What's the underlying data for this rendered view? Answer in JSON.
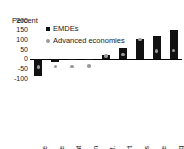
{
  "chart_data": {
    "type": "bar",
    "title": "",
    "subtitle": "",
    "xlabel": "",
    "ylabel": "Percent",
    "unit_label": "Percent",
    "ylim": [
      -100,
      200
    ],
    "yticks": [
      200,
      150,
      100,
      50,
      0,
      -50,
      -100
    ],
    "ytick_labels": [
      "200",
      "150",
      "100",
      "50",
      "0",
      "-50",
      "-100"
    ],
    "grid": false,
    "legend_position": "top-left-inside",
    "categories": [
      "Agriculture",
      "Trade",
      "Government",
      "Construction",
      "Manuf.",
      "Transport",
      "Utilities",
      "Finance",
      "Mining"
    ],
    "series": [
      {
        "name": "EMDEs",
        "marker": "square",
        "color": "#111111",
        "render": "bar",
        "values": [
          -90,
          -15,
          -5,
          -3,
          18,
          55,
          100,
          115,
          150
        ]
      },
      {
        "name": "Advanced economies",
        "marker": "circle",
        "color": "#9a9a9a",
        "render": "point",
        "values": [
          -43,
          -40,
          -40,
          -38,
          15,
          22,
          100,
          40,
          42
        ]
      }
    ]
  },
  "legend": {
    "items": [
      {
        "label": "EMDEs",
        "marker": "square",
        "color": "#111111"
      },
      {
        "label": "Advanced economies",
        "marker": "circle",
        "color": "#9a9a9a"
      }
    ]
  }
}
